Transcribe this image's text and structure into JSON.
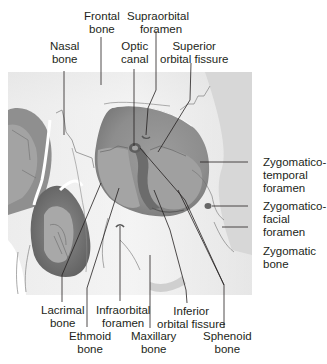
{
  "figure": {
    "colors": {
      "bone_light": "#f1f1f1",
      "bone_mid": "#d4d4d4",
      "orbit_dark": "#8a8a8a",
      "orbit_mid": "#a6a6a6",
      "orbit_deep": "#6f6f6f",
      "nasal_cavity": "#7b7b7b",
      "suture_line": "#6a6a6a",
      "leader_line": "#231f20",
      "text": "#231f20",
      "background": "#ffffff"
    }
  },
  "labels": {
    "frontal_bone": {
      "line1": "Frontal",
      "line2": "bone"
    },
    "supraorbital_foramen": {
      "line1": "Supraorbital",
      "line2": "foramen"
    },
    "nasal_bone": {
      "line1": "Nasal",
      "line2": "bone"
    },
    "optic_canal": {
      "line1": "Optic",
      "line2": "canal"
    },
    "superior_orbital_fissure": {
      "line1": "Superior",
      "line2": "orbital fissure"
    },
    "zygomaticotemporal_foramen": {
      "line1": "Zygomatico-",
      "line2": "temporal",
      "line3": "foramen"
    },
    "zygomaticofacial_foramen": {
      "line1": "Zygomatico-",
      "line2": "facial",
      "line3": "foramen"
    },
    "zygomatic_bone": {
      "line1": "Zygomatic",
      "line2": "bone"
    },
    "lacrimal_bone": {
      "line1": "Lacrimal",
      "line2": "bone"
    },
    "infraorbital_foramen": {
      "line1": "Infraorbital",
      "line2": "foramen"
    },
    "inferior_orbital_fissure": {
      "line1": "Inferior",
      "line2": "orbital fissure"
    },
    "ethmoid_bone": {
      "line1": "Ethmoid",
      "line2": "bone"
    },
    "maxillary_bone": {
      "line1": "Maxillary",
      "line2": "bone"
    },
    "sphenoid_bone": {
      "line1": "Sphenoid",
      "line2": "bone"
    }
  }
}
